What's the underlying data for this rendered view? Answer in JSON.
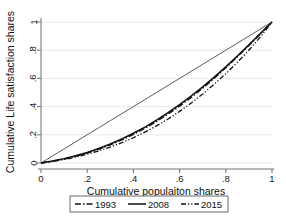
{
  "chart_data": {
    "type": "line",
    "title": "",
    "xlabel": "Cumulative populaiton shares",
    "ylabel": "Cumulative Life satisfaction shares",
    "xlim": [
      0,
      1
    ],
    "ylim": [
      0,
      1
    ],
    "grid": true,
    "grid_orientation": "horizontal",
    "legend_position": "bottom-outside",
    "xticks": [
      "0",
      ".2",
      ".4",
      ".6",
      ".8",
      "1"
    ],
    "xtick_values": [
      0,
      0.2,
      0.4,
      0.6,
      0.8,
      1
    ],
    "yticks": [
      "0",
      ".2",
      ".4",
      ".6",
      ".8",
      "1"
    ],
    "ytick_values": [
      0,
      0.2,
      0.4,
      0.6,
      0.8,
      1
    ],
    "x": [
      0,
      0.05,
      0.1,
      0.15,
      0.2,
      0.25,
      0.3,
      0.35,
      0.4,
      0.45,
      0.5,
      0.55,
      0.6,
      0.65,
      0.7,
      0.75,
      0.8,
      0.85,
      0.9,
      0.95,
      1
    ],
    "series": [
      {
        "name": "1993",
        "style": "dash-dot",
        "color": "#111111",
        "values": [
          0,
          0.013,
          0.029,
          0.048,
          0.071,
          0.098,
          0.129,
          0.164,
          0.203,
          0.247,
          0.295,
          0.347,
          0.404,
          0.465,
          0.531,
          0.601,
          0.675,
          0.753,
          0.834,
          0.916,
          1
        ]
      },
      {
        "name": "2008",
        "style": "solid",
        "color": "#111111",
        "values": [
          0,
          0.014,
          0.031,
          0.051,
          0.075,
          0.103,
          0.135,
          0.171,
          0.211,
          0.255,
          0.304,
          0.357,
          0.414,
          0.475,
          0.54,
          0.609,
          0.682,
          0.759,
          0.838,
          0.918,
          1
        ]
      },
      {
        "name": "2015",
        "style": "dash-dot-dot",
        "color": "#111111",
        "values": [
          0,
          0.011,
          0.025,
          0.042,
          0.062,
          0.086,
          0.113,
          0.144,
          0.179,
          0.219,
          0.263,
          0.312,
          0.366,
          0.425,
          0.489,
          0.559,
          0.634,
          0.714,
          0.8,
          0.895,
          1
        ]
      },
      {
        "name": "equality-line",
        "style": "solid-thin",
        "color": "#333333",
        "values": [
          0,
          0.05,
          0.1,
          0.15,
          0.2,
          0.25,
          0.3,
          0.35,
          0.4,
          0.45,
          0.5,
          0.55,
          0.6,
          0.65,
          0.7,
          0.75,
          0.8,
          0.85,
          0.9,
          0.95,
          1
        ],
        "in_legend": false
      }
    ],
    "legend": [
      {
        "label": "1993",
        "style": "dash-dot"
      },
      {
        "label": "2008",
        "style": "solid"
      },
      {
        "label": "2015",
        "style": "dash-dot-dot"
      }
    ]
  }
}
